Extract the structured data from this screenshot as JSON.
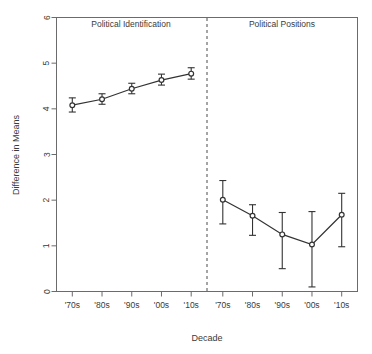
{
  "chart_data": {
    "type": "line",
    "title": "",
    "xlabel": "Decade",
    "ylabel": "Difference in Means",
    "ylim": [
      0,
      6
    ],
    "yticks": [
      0,
      1,
      2,
      3,
      4,
      5,
      6
    ],
    "grid": false,
    "legend": "none",
    "panel_divider": "dashed vertical line between panels",
    "error_bars": "95% confidence intervals (vertical whiskers)",
    "marker": "open circle with crossing whisker caps",
    "panels": [
      {
        "name": "Political Identification",
        "categories": [
          "'70s",
          "'80s",
          "'90s",
          "'00s",
          "'10s"
        ],
        "values": [
          4.08,
          4.21,
          4.44,
          4.63,
          4.77
        ],
        "err_low": [
          3.93,
          4.1,
          4.33,
          4.52,
          4.65
        ],
        "err_high": [
          4.24,
          4.33,
          4.56,
          4.76,
          4.9
        ]
      },
      {
        "name": "Political Positions",
        "categories": [
          "'70s",
          "'80s",
          "'90s",
          "'00s",
          "'10s"
        ],
        "values": [
          2.01,
          1.66,
          1.25,
          1.03,
          1.68
        ],
        "err_low": [
          1.48,
          1.23,
          0.5,
          0.1,
          0.98
        ],
        "err_high": [
          2.43,
          1.9,
          1.73,
          1.75,
          2.15
        ]
      }
    ]
  },
  "panel_titles": {
    "left": "Political Identification",
    "right": "Political Positions"
  },
  "axes": {
    "x_title": "Decade",
    "y_title": "Difference in Means",
    "y_tick_labels": [
      "0",
      "1",
      "2",
      "3",
      "4",
      "5",
      "6"
    ],
    "x_tick_labels": [
      "'70s",
      "'80s",
      "'90s",
      "'00s",
      "'10s",
      "'70s",
      "'80s",
      "'90s",
      "'00s",
      "'10s"
    ]
  },
  "colors": {
    "line": "#333333",
    "frame": "#6b6b6b",
    "text": "#3a3a3a",
    "background": "#ffffff"
  }
}
